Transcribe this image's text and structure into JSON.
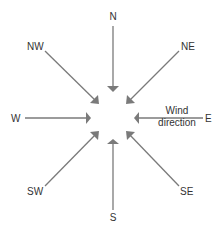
{
  "diagram": {
    "directions": [
      {
        "id": "N",
        "label": "N"
      },
      {
        "id": "NE",
        "label": "NE"
      },
      {
        "id": "E",
        "label": "E"
      },
      {
        "id": "SE",
        "label": "SE"
      },
      {
        "id": "S",
        "label": "S"
      },
      {
        "id": "SW",
        "label": "SW"
      },
      {
        "id": "W",
        "label": "W"
      },
      {
        "id": "NW",
        "label": "NW"
      }
    ],
    "annotation": {
      "line1": "Wind",
      "line2": "direction"
    },
    "colors": {
      "arrow": "#7a7a7a",
      "text": "#333333"
    }
  }
}
